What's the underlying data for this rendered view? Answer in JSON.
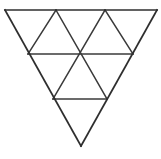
{
  "figure": {
    "background_color": "#ffffff",
    "line_color": "#3a3a3a",
    "outline_color": "#2e2e2e",
    "line_width": 1.5,
    "canvas": {
      "width": 161,
      "height": 159
    },
    "orientation": "point-down",
    "rows": 3,
    "small_triangle_count": 9,
    "upward_triangle_count": 3,
    "downward_triangle_count": 6,
    "vertices": {
      "top_left": {
        "x": 5,
        "y": 10
      },
      "top_mid_left": {
        "x": 56,
        "y": 10
      },
      "top_mid_right": {
        "x": 105,
        "y": 10
      },
      "top_right": {
        "x": 157,
        "y": 10
      },
      "mid_left": {
        "x": 28,
        "y": 54
      },
      "mid_center": {
        "x": 81,
        "y": 54
      },
      "mid_right": {
        "x": 133,
        "y": 54
      },
      "low_left": {
        "x": 53,
        "y": 99
      },
      "low_right": {
        "x": 107,
        "y": 99
      },
      "bottom_apex": {
        "x": 81,
        "y": 146
      }
    },
    "segments": [
      {
        "name": "top-edge",
        "kind": "outline",
        "x1": 5,
        "y1": 10,
        "x2": 157,
        "y2": 10
      },
      {
        "name": "left-edge",
        "kind": "outline",
        "x1": 5,
        "y1": 10,
        "x2": 81,
        "y2": 146
      },
      {
        "name": "right-edge",
        "kind": "outline",
        "x1": 157,
        "y1": 10,
        "x2": 81,
        "y2": 146
      },
      {
        "name": "horizontal-row2",
        "kind": "grid",
        "x1": 28,
        "y1": 54,
        "x2": 133,
        "y2": 54
      },
      {
        "name": "horizontal-row3",
        "kind": "grid",
        "x1": 53,
        "y1": 99,
        "x2": 107,
        "y2": 99
      },
      {
        "name": "left-diagonal-1",
        "kind": "grid",
        "x1": 56,
        "y1": 10,
        "x2": 28,
        "y2": 54
      },
      {
        "name": "left-diagonal-2",
        "kind": "grid",
        "x1": 105,
        "y1": 10,
        "x2": 53,
        "y2": 99
      },
      {
        "name": "right-diagonal-1",
        "kind": "grid",
        "x1": 56,
        "y1": 10,
        "x2": 107,
        "y2": 99
      },
      {
        "name": "right-diagonal-2",
        "kind": "grid",
        "x1": 105,
        "y1": 10,
        "x2": 133,
        "y2": 54
      }
    ]
  }
}
